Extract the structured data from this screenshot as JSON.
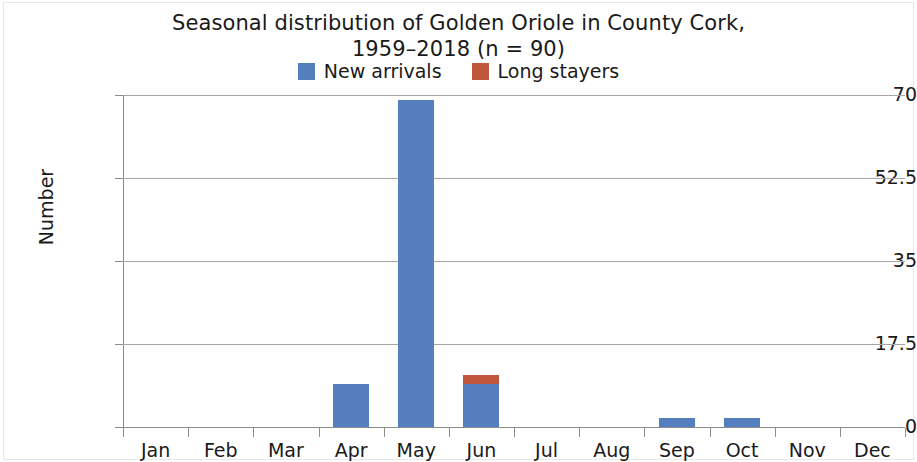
{
  "chart_data": {
    "type": "bar",
    "title": "Seasonal distribution of Golden Oriole in County Cork, 1959–2018 (n = 90)",
    "title_lines": [
      "Seasonal distribution of Golden Oriole in County Cork,",
      "1959–2018 (n = 90)"
    ],
    "xlabel": "",
    "ylabel": "Number",
    "categories": [
      "Jan",
      "Feb",
      "Mar",
      "Apr",
      "May",
      "Jun",
      "Jul",
      "Aug",
      "Sep",
      "Oct",
      "Nov",
      "Dec"
    ],
    "series": [
      {
        "name": "New arrivals",
        "color": "#557ebf",
        "values": [
          0,
          0,
          0,
          9,
          69,
          9,
          0,
          0,
          2,
          2,
          0,
          0
        ]
      },
      {
        "name": "Long stayers",
        "color": "#c0563a",
        "values": [
          0,
          0,
          0,
          0,
          0,
          2,
          0,
          0,
          0,
          0,
          0,
          0
        ]
      }
    ],
    "stacked": true,
    "ylim": [
      0,
      70
    ],
    "yticks": [
      0,
      17.5,
      35,
      52.5,
      70
    ],
    "ytick_labels": [
      "0",
      "17.5",
      "35",
      "52.5",
      "70"
    ],
    "grid": "horizontal",
    "legend_position": "top-center",
    "legend": [
      {
        "label": "New arrivals",
        "color": "#557ebf"
      },
      {
        "label": "Long stayers",
        "color": "#c0563a"
      }
    ],
    "colors": {
      "new_arrivals": "#557ebf",
      "long_stayers": "#c0563a",
      "gridline": "#a6a6a6",
      "axis": "#8c8c8c",
      "text": "#1a1a1a",
      "background": "#ffffff"
    }
  }
}
